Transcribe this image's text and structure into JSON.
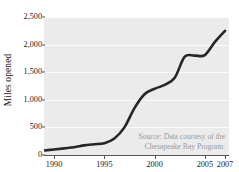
{
  "chart_data": {
    "type": "line",
    "title": "",
    "subtitle": "",
    "xlabel": "",
    "ylabel": "Miles opened",
    "xlim": [
      1989,
      2007.4
    ],
    "ylim": [
      0,
      2500
    ],
    "grid": "horizontal-only",
    "legend": "none",
    "series": [
      {
        "name": "Miles opened",
        "color": "#262626",
        "x": [
          1989,
          1990,
          1991,
          1992,
          1993,
          1994,
          1995,
          1996,
          1997,
          1998,
          1999,
          2000,
          2001,
          2002,
          2003,
          2004,
          2005,
          2006,
          2007
        ],
        "values": [
          80,
          100,
          120,
          140,
          175,
          195,
          215,
          300,
          500,
          850,
          1100,
          1200,
          1270,
          1400,
          1780,
          1800,
          1810,
          2050,
          2250
        ]
      }
    ],
    "x_ticks": [
      1990,
      1995,
      2000,
      2005,
      2007
    ],
    "x_tick_labels": [
      "1990",
      "1995",
      "2000",
      "2005",
      "2007"
    ],
    "y_ticks": [
      0,
      500,
      1000,
      1500,
      2000,
      2500
    ],
    "y_tick_labels": [
      "0",
      "500",
      "1,000",
      "1,500",
      "2,000",
      "2,500"
    ],
    "annotations": [
      {
        "name": "source-note",
        "line1": "Source: Data courtesy of the",
        "line2": "Chesapeake Bay Program.",
        "color": "#9a9a9a",
        "position": "inside-bottom-right"
      }
    ],
    "panel_background": "#ebebeb",
    "gridline_color": "#fbfbfb"
  }
}
